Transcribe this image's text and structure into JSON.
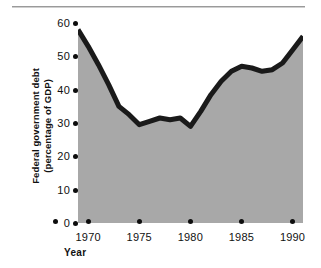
{
  "figure": {
    "background_color": "#ffffff",
    "rule_color": "#9a9a9a"
  },
  "chart_data": {
    "type": "area",
    "title": "",
    "subtitle": "",
    "xlabel": "Year",
    "ylabel": "Federal government debt (percentage of GDP)",
    "ylabel_line1": "Federal government debt",
    "ylabel_line2": "(percentage of GDP)",
    "xlim": [
      1970,
      1992
    ],
    "ylim": [
      0,
      60
    ],
    "grid": false,
    "legend": null,
    "legend_position": "none",
    "line_color": "#1a1a1a",
    "fill_color": "#a8a8a8",
    "tick_marker": "dot",
    "yticks": [
      0,
      10,
      20,
      30,
      40,
      50,
      60
    ],
    "ytick_labels": [
      "0",
      "10",
      "20",
      "30",
      "40",
      "50",
      "60"
    ],
    "xticks": [
      1970,
      1975,
      1980,
      1985,
      1990
    ],
    "xtick_labels": [
      "1970",
      "1975",
      "1980",
      "1985",
      "1990"
    ],
    "x": [
      1970,
      1971,
      1972,
      1973,
      1974,
      1975,
      1976,
      1977,
      1978,
      1979,
      1980,
      1981,
      1982,
      1983,
      1984,
      1985,
      1986,
      1987,
      1988,
      1989,
      1990,
      1991,
      1992
    ],
    "values": [
      58.0,
      53.0,
      47.5,
      41.5,
      35.0,
      32.5,
      29.5,
      30.5,
      31.5,
      31.0,
      31.5,
      29.0,
      33.5,
      38.5,
      42.5,
      45.5,
      47.0,
      46.5,
      45.5,
      46.0,
      48.0,
      52.0,
      56.0
    ],
    "series": [
      {
        "name": "Federal government debt",
        "values": [
          58.0,
          53.0,
          47.5,
          41.5,
          35.0,
          32.5,
          29.5,
          30.5,
          31.5,
          31.0,
          31.5,
          29.0,
          33.5,
          38.5,
          42.5,
          45.5,
          47.0,
          46.5,
          45.5,
          46.0,
          48.0,
          52.0,
          56.0
        ]
      }
    ]
  }
}
